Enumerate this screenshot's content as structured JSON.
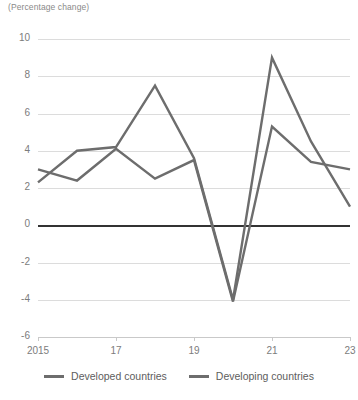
{
  "chart_data": {
    "type": "line",
    "title": "",
    "subtitle": "(Percentage change)",
    "xlabel": "",
    "ylabel": "",
    "x": [
      2015,
      2016,
      2017,
      2018,
      2019,
      2020,
      2021,
      2022,
      2023
    ],
    "xtick_values": [
      2015,
      2017,
      2019,
      2021,
      2023
    ],
    "xtick_labels": [
      "2015",
      "17",
      "19",
      "21",
      "23"
    ],
    "ytick_values": [
      10,
      8,
      6,
      4,
      2,
      0,
      -2,
      -4,
      -6
    ],
    "ytick_labels": [
      "10",
      "8",
      "6",
      "4",
      "2",
      "0",
      "-2",
      "-4",
      "-6"
    ],
    "ylim": [
      -6,
      10
    ],
    "xlim": [
      2015,
      2023
    ],
    "grid": true,
    "zero_line": true,
    "legend_position": "bottom",
    "series": [
      {
        "name": "Developed countries",
        "color": "#6d6d6d",
        "values": [
          3.0,
          2.4,
          4.1,
          2.5,
          3.5,
          -4.1,
          5.3,
          3.4,
          3.0
        ]
      },
      {
        "name": "Developing countries",
        "color": "#6d6d6d",
        "values": [
          2.3,
          4.0,
          4.2,
          7.5,
          3.6,
          -4.0,
          9.0,
          4.5,
          1.0
        ]
      }
    ]
  }
}
